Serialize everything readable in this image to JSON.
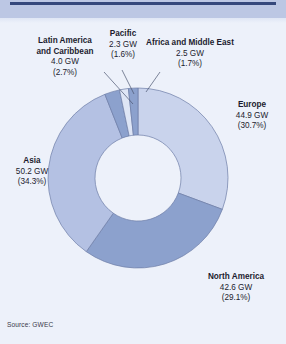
{
  "header": {
    "band_color": "#bcc7e4",
    "rule_color": "#35487c"
  },
  "source": {
    "text": "Source: GWEC"
  },
  "chart_data": {
    "type": "pie",
    "variant": "donut",
    "title": "",
    "subtitle": "",
    "xlabel": "",
    "ylabel": "",
    "unit": "GW",
    "legend_position": "callout-labels",
    "grid": false,
    "total_value": 147.5,
    "start_angle_deg": 0,
    "direction": "clockwise",
    "categories": [
      "Europe",
      "North America",
      "Asia",
      "Latin America and Caribbean",
      "Pacific",
      "Africa and Middle East"
    ],
    "values": [
      44.9,
      42.6,
      50.2,
      4.0,
      2.3,
      2.5
    ],
    "percents": [
      30.7,
      29.1,
      34.3,
      2.7,
      1.6,
      1.7
    ],
    "colors": [
      "#c9d3ec",
      "#8ca1cd",
      "#b4c1e3",
      "#8ca1cd",
      "#dee5f5",
      "#8ca1cd"
    ],
    "slices": [
      {
        "name": "Europe",
        "value_label": "44.9 GW",
        "percent_label": "(30.7%)",
        "value": 44.9,
        "percent": 30.7,
        "color": "#c9d3ec"
      },
      {
        "name": "North America",
        "value_label": "42.6 GW",
        "percent_label": "(29.1%)",
        "value": 42.6,
        "percent": 29.1,
        "color": "#8ca1cd"
      },
      {
        "name": "Asia",
        "value_label": "50.2 GW",
        "percent_label": "(34.3%)",
        "value": 50.2,
        "percent": 34.3,
        "color": "#b4c1e3"
      },
      {
        "name": "Latin America and Caribbean",
        "name_line1": "Latin America",
        "name_line2": "and Caribbean",
        "value_label": "4.0 GW",
        "percent_label": "(2.7%)",
        "value": 4.0,
        "percent": 2.7,
        "color": "#8ca1cd"
      },
      {
        "name": "Pacific",
        "value_label": "2.3 GW",
        "percent_label": "(1.6%)",
        "value": 2.3,
        "percent": 1.6,
        "color": "#dee5f5"
      },
      {
        "name": "Africa and Middle East",
        "value_label": "2.5 GW",
        "percent_label": "(1.7%)",
        "value": 2.5,
        "percent": 1.7,
        "color": "#8ca1cd"
      }
    ]
  }
}
